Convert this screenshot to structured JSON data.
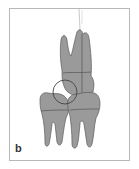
{
  "figure": {
    "panel_label": "b",
    "colors": {
      "tooth_fill": "#9a9a9a",
      "outline": "#5a5a5a",
      "frame": "#b8b8b8",
      "background": "#ffffff"
    }
  }
}
